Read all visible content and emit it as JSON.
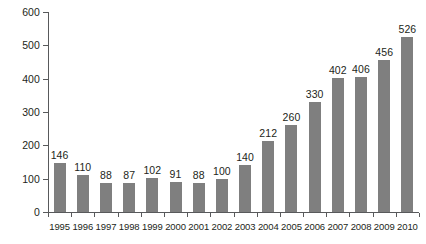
{
  "chart_data": {
    "type": "bar",
    "title": "",
    "subtitle": "",
    "xlabel": "",
    "ylabel": "",
    "categories": [
      "1995",
      "1996",
      "1997",
      "1998",
      "1999",
      "2000",
      "2001",
      "2002",
      "2003",
      "2004",
      "2005",
      "2006",
      "2007",
      "2008",
      "2009",
      "2010"
    ],
    "values": [
      146,
      110,
      88,
      87,
      102,
      91,
      88,
      100,
      140,
      212,
      260,
      330,
      402,
      406,
      456,
      526
    ],
    "data_labels": [
      "146",
      "110",
      "88",
      "87",
      "102",
      "91",
      "88",
      "100",
      "140",
      "212",
      "260",
      "330",
      "402",
      "406",
      "456",
      "526"
    ],
    "ylim": [
      0,
      600
    ],
    "y_ticks": [
      0,
      100,
      200,
      300,
      400,
      500,
      600
    ],
    "y_tick_labels": [
      "0",
      "100",
      "200",
      "300",
      "400",
      "500",
      "600"
    ],
    "grid": false,
    "legend": false,
    "legend_position": "none",
    "bar_color": "#7f7f7f",
    "axis_color": "#58595b",
    "text_color": "#231f20",
    "background_color": "#ffffff"
  }
}
